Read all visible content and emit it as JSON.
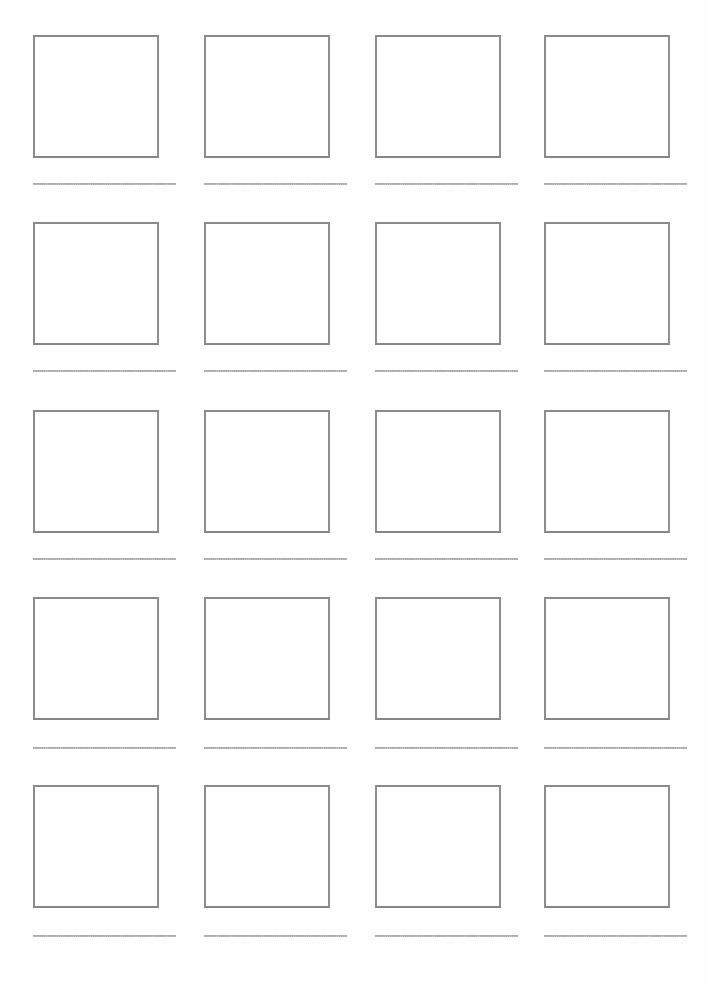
{
  "page": {
    "width": 708,
    "height": 990,
    "background_color": "#ffffff",
    "orientation": "portrait"
  },
  "colors": {
    "page_background": "#ffffff",
    "box_border": "#8a8a8a",
    "box_fill": "#ffffff",
    "writing_line_dots": "#9b9b9b"
  },
  "grid": {
    "columns": 4,
    "rows": 5,
    "total_cells": 20,
    "column_x": [
      33,
      204,
      375,
      544
    ],
    "row_y": [
      35,
      222,
      410,
      597,
      785
    ],
    "box_width": 126,
    "box_height": 123,
    "box_border_width": 2,
    "writing_line_y": [
      183,
      370,
      558,
      747,
      935
    ],
    "writing_line_width": 143,
    "column_pitch": 170,
    "row_pitch": 187
  },
  "cells": [
    {
      "id": "cell-r1-c1",
      "row": 1,
      "column": 1,
      "box_label": "",
      "line_label": ""
    },
    {
      "id": "cell-r1-c2",
      "row": 1,
      "column": 2,
      "box_label": "",
      "line_label": ""
    },
    {
      "id": "cell-r1-c3",
      "row": 1,
      "column": 3,
      "box_label": "",
      "line_label": ""
    },
    {
      "id": "cell-r1-c4",
      "row": 1,
      "column": 4,
      "box_label": "",
      "line_label": ""
    },
    {
      "id": "cell-r2-c1",
      "row": 2,
      "column": 1,
      "box_label": "",
      "line_label": ""
    },
    {
      "id": "cell-r2-c2",
      "row": 2,
      "column": 2,
      "box_label": "",
      "line_label": ""
    },
    {
      "id": "cell-r2-c3",
      "row": 2,
      "column": 3,
      "box_label": "",
      "line_label": ""
    },
    {
      "id": "cell-r2-c4",
      "row": 2,
      "column": 4,
      "box_label": "",
      "line_label": ""
    },
    {
      "id": "cell-r3-c1",
      "row": 3,
      "column": 1,
      "box_label": "",
      "line_label": ""
    },
    {
      "id": "cell-r3-c2",
      "row": 3,
      "column": 2,
      "box_label": "",
      "line_label": ""
    },
    {
      "id": "cell-r3-c3",
      "row": 3,
      "column": 3,
      "box_label": "",
      "line_label": ""
    },
    {
      "id": "cell-r3-c4",
      "row": 3,
      "column": 4,
      "box_label": "",
      "line_label": ""
    },
    {
      "id": "cell-r4-c1",
      "row": 4,
      "column": 1,
      "box_label": "",
      "line_label": ""
    },
    {
      "id": "cell-r4-c2",
      "row": 4,
      "column": 2,
      "box_label": "",
      "line_label": ""
    },
    {
      "id": "cell-r4-c3",
      "row": 4,
      "column": 3,
      "box_label": "",
      "line_label": ""
    },
    {
      "id": "cell-r4-c4",
      "row": 4,
      "column": 4,
      "box_label": "",
      "line_label": ""
    },
    {
      "id": "cell-r5-c1",
      "row": 5,
      "column": 1,
      "box_label": "",
      "line_label": ""
    },
    {
      "id": "cell-r5-c2",
      "row": 5,
      "column": 2,
      "box_label": "",
      "line_label": ""
    },
    {
      "id": "cell-r5-c3",
      "row": 5,
      "column": 3,
      "box_label": "",
      "line_label": ""
    },
    {
      "id": "cell-r5-c4",
      "row": 5,
      "column": 4,
      "box_label": "",
      "line_label": ""
    }
  ]
}
